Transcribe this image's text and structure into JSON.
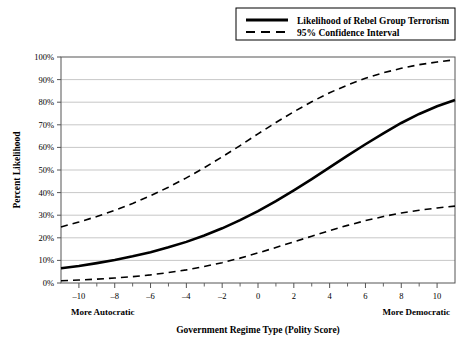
{
  "chart_data": {
    "type": "line",
    "title": "",
    "xlabel": "Government Regime Type (Polity Score)",
    "ylabel": "Percent Likelihood",
    "xlim": [
      -11,
      11
    ],
    "ylim": [
      0,
      100
    ],
    "grid": true,
    "legend_position": "top-right",
    "x_tick_labels": [
      "–10",
      "–8",
      "–6",
      "–4",
      "–2",
      "0",
      "2",
      "4",
      "6",
      "8",
      "10"
    ],
    "x_ticks": [
      -10,
      -8,
      -6,
      -4,
      -2,
      0,
      2,
      4,
      6,
      8,
      10
    ],
    "x_minor_ticks": [
      -9,
      -7,
      -5,
      -3,
      -1,
      1,
      3,
      5,
      7,
      9
    ],
    "y_tick_labels": [
      "0%",
      "10%",
      "20%",
      "30%",
      "40%",
      "50%",
      "60%",
      "70%",
      "80%",
      "90%",
      "100%"
    ],
    "y_ticks": [
      0,
      10,
      20,
      30,
      40,
      50,
      60,
      70,
      80,
      90,
      100
    ],
    "x_axis_left_annotation": "More Autocratic",
    "x_axis_right_annotation": "More Democratic",
    "x": [
      -11,
      -10,
      -9,
      -8,
      -7,
      -6,
      -5,
      -4,
      -3,
      -2,
      -1,
      0,
      1,
      2,
      3,
      4,
      5,
      6,
      7,
      8,
      9,
      10,
      11
    ],
    "series": [
      {
        "name": "Likelihood of Rebel Group Terrorism",
        "style": "solid",
        "color": "#000000",
        "width": 2.6,
        "values": [
          6.5,
          7.5,
          8.8,
          10.2,
          11.8,
          13.6,
          15.8,
          18.2,
          21.0,
          24.2,
          27.8,
          31.8,
          36.2,
          41.0,
          46.0,
          51.2,
          56.4,
          61.4,
          66.2,
          70.8,
          74.8,
          78.2,
          81.0
        ]
      },
      {
        "name": "95% Confidence Interval Upper",
        "style": "dashed",
        "color": "#000000",
        "width": 1.6,
        "values": [
          24.8,
          27.0,
          29.4,
          32.2,
          35.2,
          38.6,
          42.4,
          46.5,
          51.0,
          55.8,
          60.8,
          66.0,
          71.0,
          75.8,
          80.2,
          84.2,
          87.6,
          90.6,
          93.0,
          95.0,
          96.6,
          97.8,
          98.8
        ]
      },
      {
        "name": "95% Confidence Interval Lower",
        "style": "dashed",
        "color": "#000000",
        "width": 1.6,
        "values": [
          1.0,
          1.3,
          1.7,
          2.2,
          2.8,
          3.6,
          4.6,
          5.8,
          7.3,
          9.0,
          11.0,
          13.3,
          15.7,
          18.2,
          20.7,
          23.2,
          25.5,
          27.6,
          29.4,
          31.0,
          32.2,
          33.2,
          34.0
        ]
      }
    ],
    "legend": [
      {
        "label": "Likelihood of Rebel Group Terrorism",
        "style": "solid"
      },
      {
        "label": "95% Confidence Interval",
        "style": "dashed"
      }
    ]
  }
}
